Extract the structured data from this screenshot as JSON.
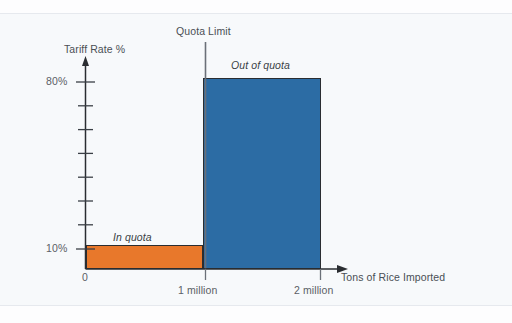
{
  "chart_data": {
    "type": "bar",
    "title": "",
    "subtitle": "",
    "xlabel": "Tons of Rice Imported",
    "ylabel": "Tariff Rate %",
    "grid": false,
    "legend": "none",
    "xlim": [
      0,
      2600000
    ],
    "ylim": [
      0,
      90
    ],
    "x_tick_labels": [
      "0",
      "1 million",
      "2 million"
    ],
    "x_tick_values": [
      0,
      1000000,
      2000000
    ],
    "y_tick_labels": [
      "10%",
      "80%"
    ],
    "y_tick_values": [
      10,
      80
    ],
    "y_minor_tick_count": 8,
    "categories": [
      "In quota",
      "Out of quota"
    ],
    "values": [
      10,
      80
    ],
    "series": [
      {
        "name": "Tariff rate by import volume",
        "points": [
          {
            "label": "In quota",
            "x_from": 0,
            "x_to": 1000000,
            "value": 10,
            "unit": "%",
            "color": "#e8782b"
          },
          {
            "label": "Out of quota",
            "x_from": 1000000,
            "x_to": 2000000,
            "value": 80,
            "unit": "%",
            "color": "#2c6ca4"
          }
        ]
      }
    ],
    "annotations": [
      {
        "name": "quota-limit",
        "text": "Quota Limit",
        "at_x": 1000000
      },
      {
        "name": "in-quota",
        "text": "In quota",
        "style": "italic"
      },
      {
        "name": "out-of-quota",
        "text": "Out of quota",
        "style": "italic"
      }
    ]
  },
  "axes": {
    "y_title": "Tariff Rate %",
    "x_title": "Tons of Rice Imported",
    "y_ticks": {
      "high": "80%",
      "low": "10%"
    },
    "x_ticks": {
      "origin": "0",
      "one": "1 million",
      "two": "2 million"
    }
  },
  "labels": {
    "quota_limit": "Quota Limit",
    "in_quota": "In quota",
    "out_of_quota": "Out of quota"
  },
  "colors": {
    "in_quota_bar": "#e8782b",
    "out_of_quota_bar": "#2c6ca4",
    "axis": "#2a2d31",
    "text": "#5b6066",
    "page_background": "#f7f9fb",
    "quota_line": "#6b7078"
  }
}
